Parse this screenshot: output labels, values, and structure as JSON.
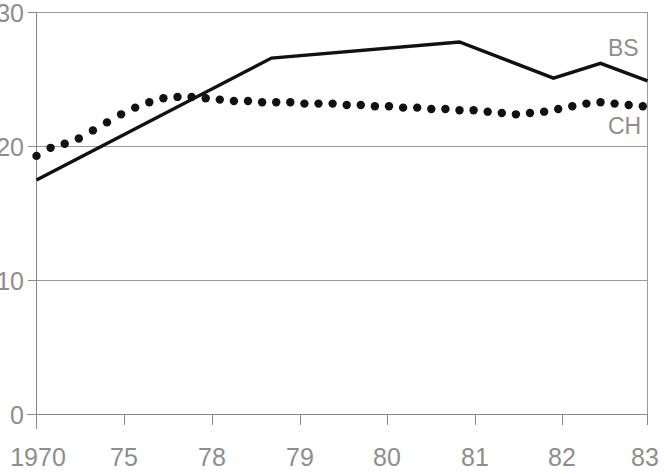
{
  "chart_data": {
    "type": "line",
    "title": "",
    "subtitle": "",
    "xlabel": "",
    "ylabel": "",
    "xlim": [
      1970,
      1983
    ],
    "ylim": [
      0,
      30
    ],
    "grid": true,
    "gridlines_y": [
      0,
      10,
      20,
      30
    ],
    "legend_position": "inline-right",
    "x_tick_labels": [
      "1970",
      "75",
      "78",
      "79",
      "80",
      "81",
      "82",
      "83"
    ],
    "x_tick_values": [
      1970,
      1975,
      1978,
      1979,
      1980,
      1981,
      1982,
      1983
    ],
    "y_tick_labels": [
      "0",
      "10",
      "20",
      "30"
    ],
    "y_tick_values": [
      0,
      10,
      20,
      30
    ],
    "series": [
      {
        "name": "BS",
        "style": "solid",
        "label": "BS",
        "x": [
          1970,
          1975,
          1979,
          1981,
          1982,
          1983
        ],
        "values": [
          17.5,
          26.6,
          27.8,
          25.1,
          26.2,
          24.9
        ]
      },
      {
        "name": "CH",
        "style": "dotted",
        "label": "CH",
        "x": [
          1970.0,
          1970.3,
          1970.6,
          1970.9,
          1971.2,
          1971.5,
          1971.8,
          1972.1,
          1972.4,
          1972.7,
          1973.0,
          1973.3,
          1973.6,
          1973.9,
          1974.2,
          1974.5,
          1974.8,
          1975.1,
          1975.4,
          1975.7,
          1976.0,
          1976.3,
          1976.6,
          1976.9,
          1977.2,
          1977.5,
          1977.8,
          1978.1,
          1978.4,
          1978.7,
          1979.0,
          1979.3,
          1979.6,
          1979.9,
          1980.2,
          1980.5,
          1980.8,
          1981.1,
          1981.4,
          1981.7,
          1982.0,
          1982.3,
          1982.6,
          1982.9
        ],
        "values": [
          19.3,
          19.9,
          20.2,
          20.6,
          21.2,
          21.8,
          22.4,
          22.9,
          23.3,
          23.6,
          23.7,
          23.7,
          23.6,
          23.5,
          23.4,
          23.4,
          23.3,
          23.3,
          23.3,
          23.2,
          23.2,
          23.2,
          23.1,
          23.1,
          23.0,
          23.0,
          22.9,
          22.9,
          22.8,
          22.8,
          22.7,
          22.7,
          22.6,
          22.5,
          22.4,
          22.5,
          22.6,
          22.8,
          23.0,
          23.2,
          23.3,
          23.2,
          23.1,
          23.0
        ]
      }
    ],
    "colors": {
      "series_line": "#111111",
      "axis": "#8a8a8a",
      "grid": "#9a9a9a",
      "tick_text": "#8e8e8e",
      "background": "#ffffff"
    }
  },
  "labels": {
    "y_30": "30",
    "y_20": "20",
    "y_10": "10",
    "y_0": "0",
    "x_1970": "1970",
    "x_75": "75",
    "x_78": "78",
    "x_79": "79",
    "x_80": "80",
    "x_81": "81",
    "x_82": "82",
    "x_83": "83",
    "series_bs": "BS",
    "series_ch": "CH"
  }
}
